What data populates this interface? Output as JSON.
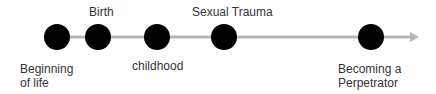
{
  "diagram": {
    "type": "timeline",
    "colors": {
      "line": "#b5b5b5",
      "node": "#000000",
      "text": "#333333",
      "background": "#ffffff"
    },
    "axis": {
      "y": 37,
      "x_start": 57,
      "x_end": 418,
      "arrow": "arrow-right"
    },
    "nodes": [
      {
        "id": "beginning-of-life",
        "cx": 57,
        "label": "Beginning\nof life",
        "label_position": "below",
        "lx": 20,
        "ly": 62
      },
      {
        "id": "birth",
        "cx": 98,
        "label": "Birth",
        "label_position": "above",
        "lx": 89,
        "ly": 5
      },
      {
        "id": "childhood",
        "cx": 157,
        "label": "childhood",
        "label_position": "below",
        "lx": 132,
        "ly": 59
      },
      {
        "id": "sexual-trauma",
        "cx": 224,
        "label": "Sexual Trauma",
        "label_position": "above",
        "lx": 192,
        "ly": 5
      },
      {
        "id": "becoming-perpetrator",
        "cx": 371,
        "label": "Becoming a\nPerpetrator",
        "label_position": "below",
        "lx": 338,
        "ly": 62
      }
    ],
    "node_radius": 13
  }
}
